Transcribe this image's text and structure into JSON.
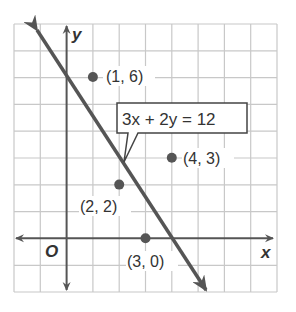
{
  "graph": {
    "axis_labels": {
      "x": "x",
      "y": "y",
      "origin": "O"
    },
    "equation": "3x + 2y = 12",
    "points": [
      {
        "label": "(1, 6)",
        "x": 1,
        "y": 6
      },
      {
        "label": "(4, 3)",
        "x": 4,
        "y": 3
      },
      {
        "label": "(2, 2)",
        "x": 2,
        "y": 2
      },
      {
        "label": "(3, 0)",
        "x": 3,
        "y": 0
      }
    ],
    "line": {
      "from": [
        -1,
        7.5
      ],
      "to": [
        5.3,
        -1.95
      ]
    },
    "grid": {
      "xmin": -2,
      "xmax": 8,
      "ymin": -2,
      "ymax": 8
    },
    "colors": {
      "grid": "#c8c8c8",
      "axis": "#555555",
      "line": "#555555",
      "point": "#555555"
    }
  }
}
